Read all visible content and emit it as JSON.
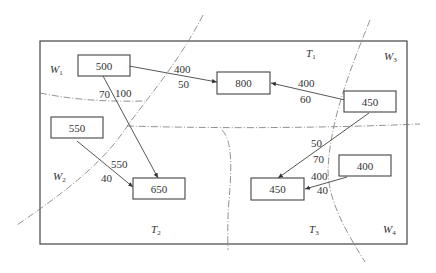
{
  "diagram": {
    "regions": [
      {
        "id": "W1",
        "letter": "W",
        "sub": "1"
      },
      {
        "id": "W2",
        "letter": "W",
        "sub": "2"
      },
      {
        "id": "W3",
        "letter": "W",
        "sub": "3"
      },
      {
        "id": "W4",
        "letter": "W",
        "sub": "4"
      },
      {
        "id": "T1",
        "letter": "T",
        "sub": "1"
      },
      {
        "id": "T2",
        "letter": "T",
        "sub": "2"
      },
      {
        "id": "T3",
        "letter": "T",
        "sub": "3"
      }
    ],
    "nodes": [
      {
        "id": "n500",
        "value": "500",
        "region": "W1"
      },
      {
        "id": "n550",
        "value": "550",
        "region": "W2"
      },
      {
        "id": "n800",
        "value": "800",
        "region": "T1"
      },
      {
        "id": "n650",
        "value": "650",
        "region": "T2"
      },
      {
        "id": "n450a",
        "value": "450",
        "region": "W3"
      },
      {
        "id": "n400",
        "value": "400",
        "region": "W4"
      },
      {
        "id": "n450b",
        "value": "450",
        "region": "T3"
      }
    ],
    "edges": [
      {
        "from": "n500",
        "to": "n800",
        "top": "400",
        "bottom": "50"
      },
      {
        "from": "n500",
        "to": "n650",
        "top": "100",
        "bottom": "70"
      },
      {
        "from": "n550",
        "to": "n650",
        "top": "550",
        "bottom": "40"
      },
      {
        "from": "n450a",
        "to": "n800",
        "top": "400",
        "bottom": "60"
      },
      {
        "from": "n450a",
        "to": "n450b",
        "top": "50",
        "bottom": "70"
      },
      {
        "from": "n400",
        "to": "n450b",
        "top": "400",
        "bottom": "40"
      }
    ]
  }
}
